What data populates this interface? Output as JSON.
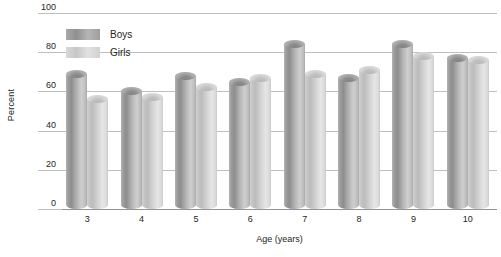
{
  "chart_data": {
    "type": "bar",
    "title": "",
    "xlabel": "Age (years)",
    "ylabel": "Percent",
    "categories": [
      "3",
      "4",
      "5",
      "6",
      "7",
      "8",
      "9",
      "10"
    ],
    "series": [
      {
        "name": "Boys",
        "values": [
          69,
          60,
          68,
          65,
          84,
          67,
          84,
          77
        ]
      },
      {
        "name": "Girls",
        "values": [
          56,
          57,
          62,
          67,
          69,
          71,
          78,
          76
        ]
      }
    ],
    "ylim": [
      0,
      100
    ],
    "yticks": [
      0,
      20,
      40,
      60,
      80,
      100
    ],
    "ytick_labels": [
      "0",
      "20",
      "40",
      "60",
      "80",
      "100"
    ],
    "grid": true,
    "legend_position": "top-left",
    "colors": {
      "boys": "#8e8e8e",
      "girls": "#cfcfcf",
      "gridline": "#bcbec0",
      "axis": "#939598",
      "text": "#231f20",
      "background": "#ffffff"
    }
  },
  "legend": {
    "entries": [
      {
        "label": "Boys"
      },
      {
        "label": "Girls"
      }
    ]
  },
  "axes": {
    "y_title": "Percent",
    "x_title": "Age (years)"
  }
}
